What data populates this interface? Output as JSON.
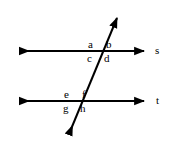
{
  "diagram": {
    "type": "parallel-lines-transversal",
    "background_color": "#ffffff",
    "stroke_color": "#000000",
    "stroke_width": 2,
    "canvas": {
      "width": 171,
      "height": 146
    },
    "lines": [
      {
        "name": "line-s",
        "label": "s",
        "orientation": "horizontal",
        "y": 51,
        "x_start": 16,
        "x_end": 148,
        "arrows": "both",
        "label_x": 155,
        "label_y": 45
      },
      {
        "name": "line-t",
        "label": "t",
        "orientation": "horizontal",
        "y": 101,
        "x_start": 16,
        "x_end": 148,
        "arrows": "both",
        "label_x": 156,
        "label_y": 95
      },
      {
        "name": "transversal",
        "label": "",
        "orientation": "oblique",
        "x_start": 66,
        "y_start": 141,
        "x_end": 120,
        "y_end": 11,
        "arrows": "both"
      }
    ],
    "intersections": [
      {
        "name": "upper-intersection",
        "line": "s",
        "x": 102,
        "y": 51
      },
      {
        "name": "lower-intersection",
        "line": "t",
        "x": 78,
        "y": 101
      }
    ],
    "angle_labels": [
      {
        "id": "a",
        "text": "a",
        "x": 88,
        "y": 39,
        "position": "upper-left"
      },
      {
        "id": "b",
        "text": "b",
        "x": 106,
        "y": 39,
        "position": "upper-right"
      },
      {
        "id": "c",
        "text": "c",
        "x": 87,
        "y": 53,
        "position": "lower-left"
      },
      {
        "id": "d",
        "text": "d",
        "x": 104,
        "y": 53,
        "position": "lower-right"
      },
      {
        "id": "e",
        "text": "e",
        "x": 64,
        "y": 89,
        "position": "upper-left"
      },
      {
        "id": "f",
        "text": "f",
        "x": 82,
        "y": 89,
        "position": "upper-right"
      },
      {
        "id": "g",
        "text": "g",
        "x": 63,
        "y": 103,
        "position": "lower-left"
      },
      {
        "id": "h",
        "text": "h",
        "x": 80,
        "y": 103,
        "position": "lower-right"
      }
    ],
    "line_labels": [
      {
        "id": "s",
        "text": "s"
      },
      {
        "id": "t",
        "text": "t"
      }
    ]
  }
}
